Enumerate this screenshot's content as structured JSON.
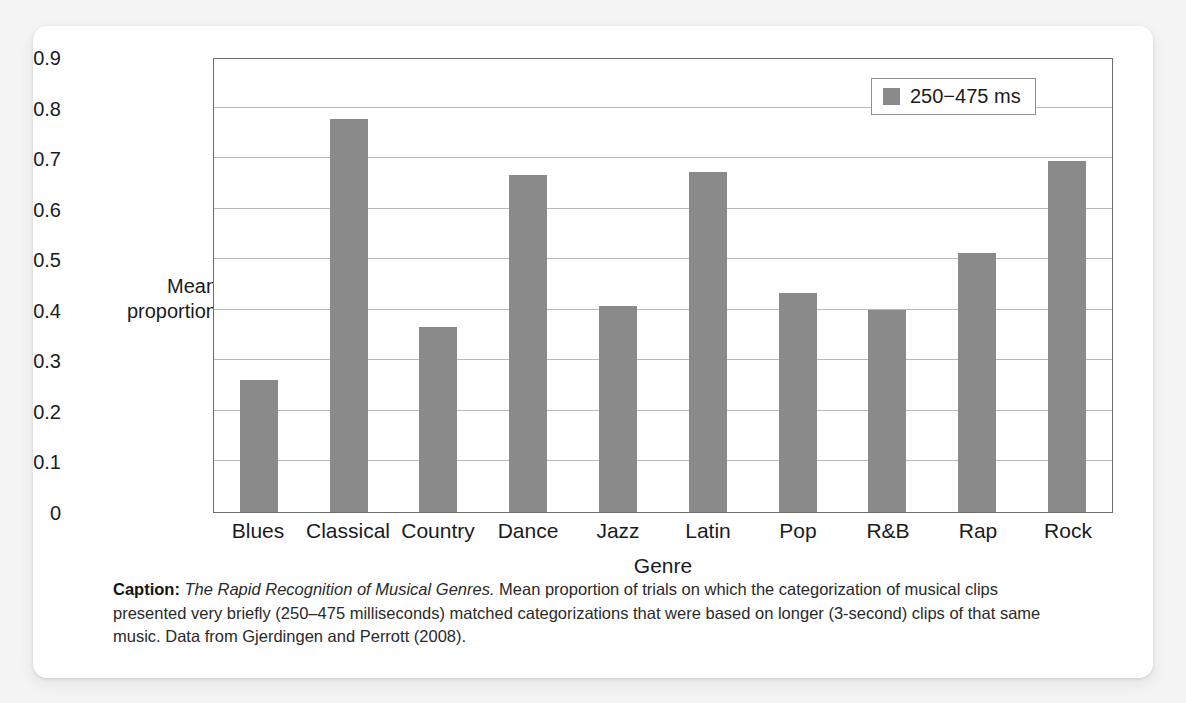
{
  "figure": {
    "y_axis_title": "Mean\nproportion",
    "x_axis_title": "Genre",
    "legend_label": "250−475 ms",
    "legend_swatch_name": "legend-color-swatch",
    "bar_color": "#8a8a8a",
    "gridline_color": "#b9b9b9",
    "frame_color": "#6c6c6c"
  },
  "caption": {
    "label": "Caption:",
    "title": "The Rapid Recognition of Musical Genres.",
    "body": " Mean proportion of trials on which the categorization of musical clips presented very briefly (250–475 milliseconds) matched categorizations that were based on longer (3-second) clips of that same music. Data from Gjerdingen and Perrott (2008)."
  },
  "chart_data": {
    "type": "bar",
    "title": "The Rapid Recognition of Musical Genres",
    "xlabel": "Genre",
    "ylabel": "Mean proportion",
    "ylim": [
      0,
      0.9
    ],
    "yticks": [
      "0",
      "0.1",
      "0.2",
      "0.3",
      "0.4",
      "0.5",
      "0.6",
      "0.7",
      "0.8",
      "0.9"
    ],
    "ytick_values": [
      0,
      0.1,
      0.2,
      0.3,
      0.4,
      0.5,
      0.6,
      0.7,
      0.8,
      0.9
    ],
    "grid": true,
    "legend_position": "top-right",
    "categories": [
      "Blues",
      "Classical",
      "Country",
      "Dance",
      "Jazz",
      "Latin",
      "Pop",
      "R&B",
      "Rap",
      "Rock"
    ],
    "series": [
      {
        "name": "250−475 ms",
        "color": "#8a8a8a",
        "values": [
          0.262,
          0.777,
          0.365,
          0.667,
          0.408,
          0.673,
          0.434,
          0.399,
          0.513,
          0.695
        ]
      }
    ]
  }
}
